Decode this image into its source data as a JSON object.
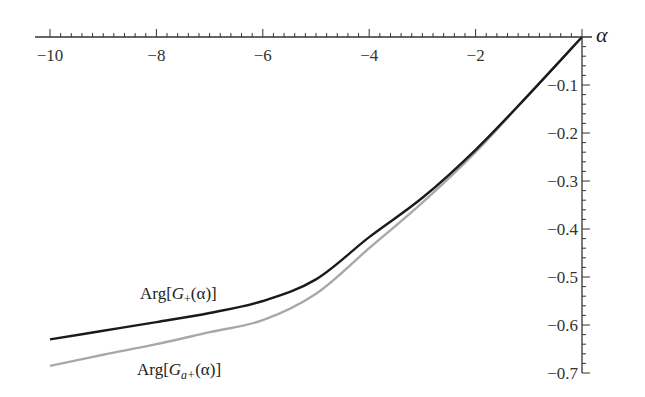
{
  "chart_data": {
    "type": "line",
    "title": "",
    "xlabel": "α",
    "ylabel": "",
    "xlim": [
      -10,
      0
    ],
    "ylim": [
      -0.7,
      0
    ],
    "grid": false,
    "legend_position": "inline labels near curves",
    "x_ticks": [
      "−10",
      "−8",
      "−6",
      "−4",
      "−2"
    ],
    "y_ticks": [
      "−0.1",
      "−0.2",
      "−0.3",
      "−0.4",
      "−0.5",
      "−0.6",
      "−0.7"
    ],
    "x": [
      -10,
      -9,
      -8,
      -7,
      -6,
      -5,
      -4,
      -3,
      -2,
      -1,
      0
    ],
    "series": [
      {
        "name": "Arg[G+(α)]",
        "color": "#1a1a1a",
        "values": [
          -0.63,
          -0.612,
          -0.594,
          -0.575,
          -0.55,
          -0.505,
          -0.417,
          -0.335,
          -0.235,
          -0.12,
          0
        ]
      },
      {
        "name": "Arg[Ga+(α)]",
        "color": "#a8a8a8",
        "values": [
          -0.685,
          -0.662,
          -0.64,
          -0.615,
          -0.59,
          -0.535,
          -0.44,
          -0.345,
          -0.24,
          -0.12,
          0
        ]
      }
    ],
    "annotations": [
      "Arg[G+(α)]",
      "Arg[Ga+(α)]"
    ]
  },
  "labels": {
    "axis_x": "α",
    "curve1_main": "Arg[",
    "curve1_G": "G",
    "curve1_sub": "+",
    "curve1_tail": "(α)]",
    "curve2_main": "Arg[",
    "curve2_G": "G",
    "curve2_sub": "a+",
    "curve2_tail": "(α)]"
  }
}
